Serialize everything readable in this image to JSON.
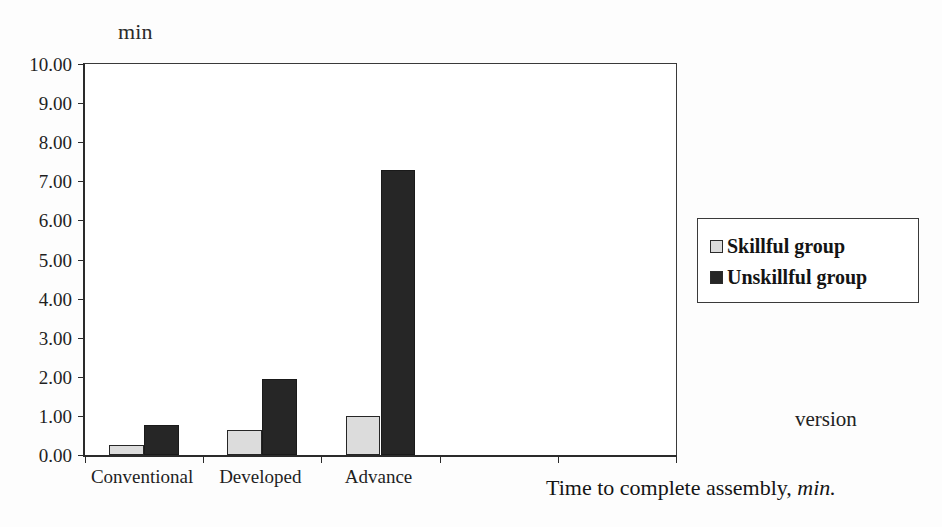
{
  "chart_data": {
    "type": "bar",
    "title": "",
    "subtitle": "",
    "xlabel": "version",
    "ylabel": "min",
    "caption": "Time to complete assembly, min.",
    "caption_main": "Time to complete assembly,",
    "caption_italic": "min.",
    "categories": [
      "Conventional",
      "Developed",
      "Advance"
    ],
    "series": [
      {
        "name": "Skillful group",
        "color": "#dcdcdc",
        "edge_color": "#262626",
        "values": [
          0.25,
          0.65,
          1.0
        ]
      },
      {
        "name": "Unskillful group",
        "color": "#262626",
        "edge_color": "#1a1a1a",
        "values": [
          0.78,
          1.95,
          7.28
        ]
      }
    ],
    "ylim": [
      0,
      10
    ],
    "ytick_step": 1,
    "ytick_labels": [
      "10.00",
      "9.00",
      "8.00",
      "7.00",
      "6.00",
      "5.00",
      "4.00",
      "3.00",
      "2.00",
      "1.00",
      "0.00"
    ],
    "ytick_values": [
      10,
      9,
      8,
      7,
      6,
      5,
      4,
      3,
      2,
      1,
      0
    ],
    "xtick_slots": 5,
    "grid": false,
    "legend_position": "outside-right"
  },
  "legend": {
    "items": [
      {
        "label": "Skillful group",
        "swatch": "skillful"
      },
      {
        "label": "Unskillful group",
        "swatch": "unskillful"
      }
    ]
  }
}
